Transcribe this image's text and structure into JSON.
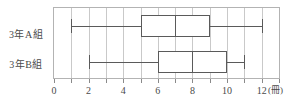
{
  "chart_data": {
    "type": "boxplot",
    "orientation": "horizontal",
    "title": "",
    "xlabel": "",
    "ylabel": "",
    "unit_label": "(冊)",
    "xlim": [
      0,
      13
    ],
    "xticks_major": [
      0,
      2,
      4,
      6,
      8,
      10,
      12
    ],
    "xtick_labels": [
      "0",
      "2",
      "4",
      "6",
      "8",
      "10",
      "12"
    ],
    "gridlines": [
      0,
      1,
      2,
      3,
      4,
      5,
      6,
      7,
      8,
      9,
      10,
      11,
      12,
      13
    ],
    "grid": true,
    "legend": "none",
    "categories": [
      "3年A組",
      "3年B組"
    ],
    "series": [
      {
        "name": "3年A組",
        "min": 1,
        "q1": 5,
        "median": 7,
        "q3": 9,
        "max": 12
      },
      {
        "name": "3年B組",
        "min": 2,
        "q1": 6,
        "median": 8,
        "q3": 10,
        "max": 11
      }
    ]
  },
  "colors": {
    "box_stroke": "#5a5a5a",
    "box_fill": "#ffffff",
    "gridline": "#c9c9c9",
    "frame": "#b3b3b3",
    "text": "#4a4a4a",
    "background": "#ffffff"
  }
}
